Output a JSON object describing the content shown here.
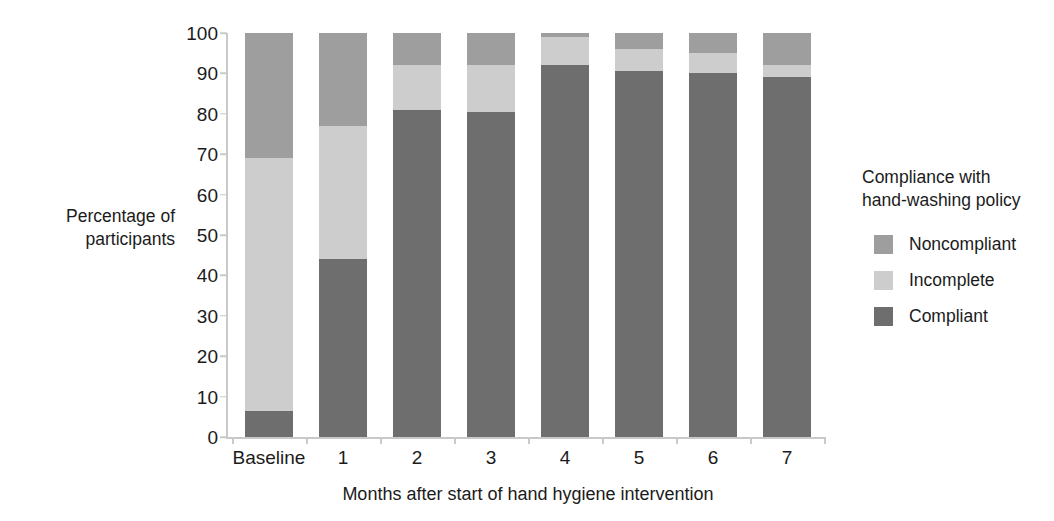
{
  "chart_data": {
    "type": "bar",
    "stacked": true,
    "title": "",
    "xlabel": "Months after start of hand hygiene intervention",
    "ylabel": "Percentage of\nparticipants",
    "categories": [
      "Baseline",
      "1",
      "2",
      "3",
      "4",
      "5",
      "6",
      "7"
    ],
    "ylim": [
      0,
      100
    ],
    "yticks": [
      0,
      10,
      20,
      30,
      40,
      50,
      60,
      70,
      80,
      90,
      100
    ],
    "ytick_labels": [
      "0",
      "10",
      "20",
      "30",
      "40",
      "50",
      "60",
      "70",
      "80",
      "90",
      "100"
    ],
    "grid": false,
    "legend_position": "right",
    "legend_title": "Compliance with\nhand-washing policy",
    "series": [
      {
        "name": "Compliant",
        "color": "#6e6e6e",
        "values": [
          6.5,
          44.0,
          81.0,
          80.5,
          92.0,
          90.5,
          90.0,
          89.0
        ]
      },
      {
        "name": "Incomplete",
        "color": "#cdcdcd",
        "values": [
          62.5,
          33.0,
          11.0,
          11.5,
          7.0,
          5.5,
          5.0,
          3.0
        ]
      },
      {
        "name": "Noncompliant",
        "color": "#9e9e9e",
        "values": [
          31.0,
          23.0,
          8.0,
          8.0,
          1.0,
          4.0,
          5.0,
          8.0
        ]
      }
    ],
    "legend_order": [
      "Noncompliant",
      "Incomplete",
      "Compliant"
    ],
    "axis_color": "#c9c9c9"
  }
}
